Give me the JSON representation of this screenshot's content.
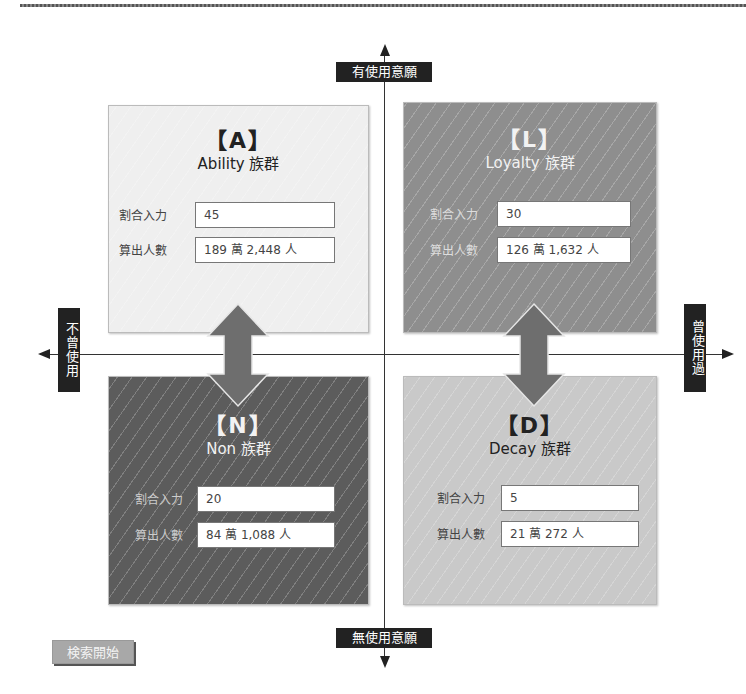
{
  "axes": {
    "top": "有使用意願",
    "bottom": "無使用意願",
    "left": "不曾使用",
    "right": "曾使用過"
  },
  "quadrants": {
    "A": {
      "letter": "【A】",
      "name": "Ability 族群",
      "ratio_label": "割合入力",
      "ratio_value": "45",
      "count_label": "算出人數",
      "count_value": "189 萬 2,448 人"
    },
    "L": {
      "letter": "【L】",
      "name": "Loyalty 族群",
      "ratio_label": "割合入力",
      "ratio_value": "30",
      "count_label": "算出人數",
      "count_value": "126 萬 1,632 人"
    },
    "N": {
      "letter": "【N】",
      "name": "Non 族群",
      "ratio_label": "割合入力",
      "ratio_value": "20",
      "count_label": "算出人數",
      "count_value": "84 萬 1,088 人"
    },
    "D": {
      "letter": "【D】",
      "name": "Decay 族群",
      "ratio_label": "割合入力",
      "ratio_value": "5",
      "count_label": "算出人數",
      "count_value": "21 萬 272 人"
    }
  },
  "search_button": "検索開始",
  "colors": {
    "A": "#efefef",
    "L": "#8e8e8e",
    "N": "#5c5c5c",
    "D": "#c9c9c9",
    "arrow": "#6e6e6e"
  }
}
